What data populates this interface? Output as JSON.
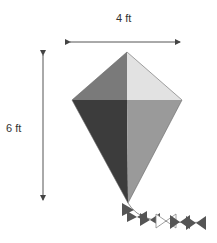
{
  "diagram": {
    "width_dimension": {
      "label": "4 ft",
      "orientation": "horizontal"
    },
    "height_dimension": {
      "label": "6 ft",
      "orientation": "vertical"
    },
    "kite": {
      "shape": "kite quadrilateral split into four triangles",
      "colors": {
        "top_left": "#7a7a7a",
        "top_right": "#e2e2e2",
        "bottom_left": "#3c3c3c",
        "bottom_right": "#9a9a9a"
      }
    },
    "tail": {
      "bows": 6,
      "color": "#555555",
      "outline_bow_color": "#888888"
    }
  }
}
